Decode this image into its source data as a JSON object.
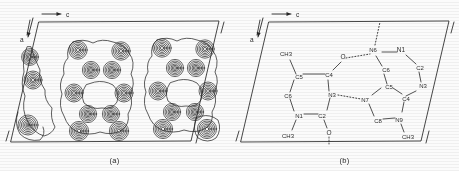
{
  "figure": {
    "type": "crystallographic-figure",
    "background_color": "#ffffff",
    "line_color": "#1a1a1a"
  },
  "panels": [
    {
      "id": "a",
      "caption": "(a)",
      "name": "electron-density-map",
      "axes": [
        {
          "label": "c",
          "direction": "horizontal-right",
          "name": "axis-c"
        },
        {
          "label": "a",
          "direction": "down-left",
          "name": "axis-a"
        }
      ],
      "cell": {
        "shape": "parallelogram",
        "description": "monoclinic unit cell outline with corner tick marks"
      },
      "contours": {
        "style": "concentric-closed-loops",
        "levels_per_atom": 6,
        "description": "nested electron density contour rings centred on each atomic site, with an outer envelope enclosing each molecule"
      }
    },
    {
      "id": "b",
      "caption": "(b)",
      "name": "molecular-structure-diagram",
      "axes": [
        {
          "label": "c",
          "direction": "horizontal-right",
          "name": "axis-c"
        },
        {
          "label": "a",
          "direction": "down-left",
          "name": "axis-a"
        }
      ],
      "cell": {
        "shape": "parallelogram",
        "description": "monoclinic unit cell outline with corner tick marks"
      },
      "atom_labels": {
        "pyrimidine": [
          "CH3",
          "C5",
          "C4",
          "O",
          "C6",
          "N3",
          "N1",
          "C2",
          "O",
          "CH3"
        ],
        "purine": [
          "N6",
          "N1",
          "C6",
          "C2",
          "N3",
          "C5",
          "C4",
          "N7",
          "C8",
          "N9",
          "CH3"
        ]
      },
      "hydrogen_bonds": [
        {
          "from": "O",
          "to": "N6",
          "style": "dotted",
          "name": "hbond-o-n6"
        },
        {
          "from": "N3",
          "to": "N7",
          "style": "dotted",
          "name": "hbond-n3-n7"
        },
        {
          "from": "N6",
          "to": "neighbour-cell",
          "style": "dotted",
          "name": "hbond-n6-up"
        },
        {
          "from": "O",
          "to": "neighbour-cell",
          "style": "dotted",
          "name": "hbond-o-down"
        }
      ]
    }
  ],
  "labels": {
    "axis_c": "c",
    "axis_a": "a",
    "caption_a": "(a)",
    "caption_b": "(b)",
    "ch3": "CH3",
    "o": "O",
    "n1": "N1",
    "n3": "N3",
    "n6": "N6",
    "n7": "N7",
    "n9": "N9",
    "c2": "C2",
    "c4": "C4",
    "c5": "C5",
    "c6": "C6",
    "c8": "C8"
  }
}
